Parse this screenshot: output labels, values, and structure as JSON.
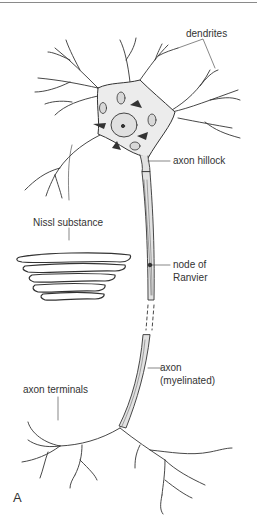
{
  "figure": {
    "panel_label": "A",
    "labels": {
      "dendrites": "dendrites",
      "axon_hillock": "axon hillock",
      "nissl_substance": "Nissl substance",
      "node_of_ranvier_line1": "node of",
      "node_of_ranvier_line2": "Ranvier",
      "axon_line1": "axon",
      "axon_line2": "(myelinated)",
      "axon_terminals": "axon terminals"
    },
    "colors": {
      "ink": "#333333",
      "soma_fill": "#ececec",
      "axon_fill": "#e2e2e2"
    }
  }
}
